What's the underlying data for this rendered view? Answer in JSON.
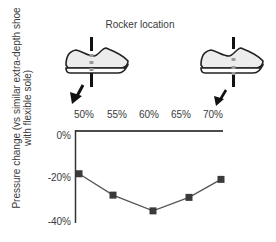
{
  "chart_data": {
    "type": "line",
    "title": "Rocker location",
    "xlabel": "Rocker location",
    "ylabel": "Pressure change (vs similar extra-depth shoe with flexible sole)",
    "ylabel_lines": [
      "Pressure change (vs similar extra-depth shoe",
      "with flexible sole)"
    ],
    "categories": [
      "50%",
      "55%",
      "60%",
      "65%",
      "70%"
    ],
    "series": [
      {
        "name": "Pressure change",
        "values": [
          -19,
          -28.5,
          -35.5,
          -29.5,
          -21.5
        ],
        "marker": "square",
        "color": "#3a3a3a"
      }
    ],
    "ylim": [
      -40,
      0
    ],
    "yticks": [
      "0%",
      "-20%",
      "-40%"
    ],
    "grid": false,
    "legend": "none",
    "annotations": [
      {
        "type": "shoe-icon",
        "position": "left",
        "rocker_at": "50%"
      },
      {
        "type": "shoe-icon",
        "position": "right",
        "rocker_at": "70%"
      }
    ]
  },
  "figure": {
    "title": "Rocker location",
    "ylabel_line1": "Pressure change (vs similar extra-depth shoe",
    "ylabel_line2": "with flexible sole)",
    "x_ticks": [
      "50%",
      "55%",
      "60%",
      "65%",
      "70%"
    ],
    "y_ticks": [
      "0%",
      "-20%",
      "-40%"
    ],
    "line_color": "#555555",
    "marker_color": "#3a3a3a"
  }
}
